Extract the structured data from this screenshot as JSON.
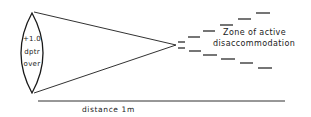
{
  "diagram": {
    "lens": {
      "label_line1": "+1.0",
      "label_line2": "dptr",
      "label_line3": "over"
    },
    "zone": {
      "label_line1": "Zone of active",
      "label_line2": "disaccommodation"
    },
    "axis": {
      "label": "distance 1m"
    },
    "colors": {
      "stroke": "#1a1a1a",
      "background": "#ffffff"
    }
  }
}
